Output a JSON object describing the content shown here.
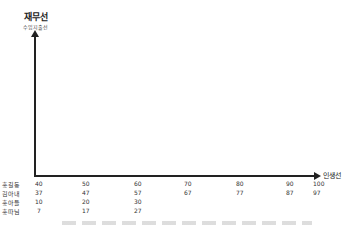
{
  "diagram": {
    "y_axis": {
      "title": "재무선",
      "subtitle": "수입지출선"
    },
    "x_axis": {
      "title": "인생선"
    },
    "rows": [
      {
        "label": "홍길동",
        "values": [
          "40",
          "50",
          "60",
          "70",
          "80",
          "90",
          "100"
        ]
      },
      {
        "label": "김아내",
        "values": [
          "37",
          "47",
          "57",
          "67",
          "77",
          "87",
          "97"
        ]
      },
      {
        "label": "홍아들",
        "values": [
          "10",
          "20",
          "30"
        ]
      },
      {
        "label": "홍따님",
        "values": [
          "7",
          "17",
          "27"
        ]
      }
    ]
  }
}
